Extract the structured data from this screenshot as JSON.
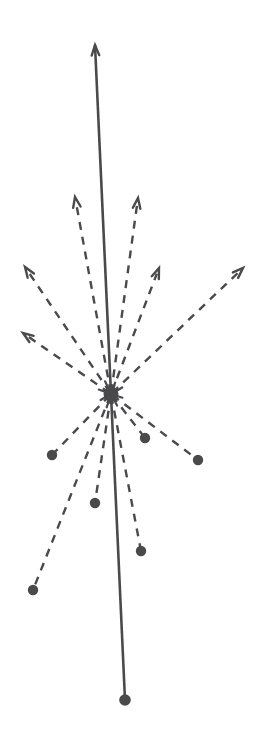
{
  "figure": {
    "type": "vector-field-radial",
    "canvas": {
      "width": 274,
      "height": 745,
      "background_color": "#ffffff"
    },
    "style": {
      "stroke_color": "#4a4a4d",
      "solid_stroke_width": 2.6,
      "dashed_stroke_width": 2.4,
      "dash_pattern": "8 7",
      "arrowhead_stroke_width": 2.4,
      "arrowhead_length": 11,
      "arrowhead_half_angle_deg": 20,
      "dot_radius": 5.2,
      "hub_radius": 7.5
    },
    "hub": {
      "label": "center-hub",
      "x": 111,
      "y": 394,
      "radius": 7.5
    },
    "axis": {
      "label": "principal-axis",
      "kind": "solid",
      "terminal_top": "arrowhead",
      "terminal_bottom": "dot",
      "top_x": 95,
      "top_y": 45,
      "bottom_x": 125,
      "bottom_y": 700
    },
    "vectors": [
      {
        "id": "v1",
        "label": "dashed-vector-up-left-near",
        "terminal": "arrowhead",
        "x": 75,
        "y": 197,
        "length": 198,
        "angle_deg": 100.4
      },
      {
        "id": "v2",
        "label": "dashed-vector-up-right-near",
        "terminal": "arrowhead",
        "x": 138,
        "y": 198,
        "length": 198,
        "angle_deg": 81.9
      },
      {
        "id": "v3",
        "label": "dashed-vector-upper-left-far",
        "terminal": "arrowhead",
        "x": 25,
        "y": 267,
        "length": 152,
        "angle_deg": 123.2
      },
      {
        "id": "v4",
        "label": "dashed-vector-left",
        "terminal": "arrowhead",
        "x": 23,
        "y": 333,
        "length": 107,
        "angle_deg": 144.6
      },
      {
        "id": "v5",
        "label": "dashed-vector-upper-right-mid",
        "terminal": "arrowhead",
        "x": 159,
        "y": 268,
        "length": 135,
        "angle_deg": 69.2
      },
      {
        "id": "v6",
        "label": "dashed-vector-right-far",
        "terminal": "arrowhead",
        "x": 243,
        "y": 268,
        "length": 183,
        "angle_deg": 40.4
      },
      {
        "id": "v7",
        "label": "dashed-vector-lower-left-short",
        "terminal": "dot",
        "x": 52,
        "y": 455,
        "length": 84,
        "angle_deg": -135.9
      },
      {
        "id": "v8",
        "label": "dashed-vector-lower-right-short",
        "terminal": "dot",
        "x": 145,
        "y": 438,
        "length": 56,
        "angle_deg": -52.3
      },
      {
        "id": "v9",
        "label": "dashed-vector-lower-right-mid",
        "terminal": "dot",
        "x": 198,
        "y": 460,
        "length": 108,
        "angle_deg": -37.2
      },
      {
        "id": "v10",
        "label": "dashed-vector-down-left-mid",
        "terminal": "dot",
        "x": 95,
        "y": 503,
        "length": 110,
        "angle_deg": -98.3
      },
      {
        "id": "v11",
        "label": "dashed-vector-down-right-long",
        "terminal": "dot",
        "x": 141,
        "y": 551,
        "length": 160,
        "angle_deg": -79.3
      },
      {
        "id": "v12",
        "label": "dashed-vector-lower-left-long",
        "terminal": "dot",
        "x": 33,
        "y": 590,
        "length": 211,
        "angle_deg": -111.7
      }
    ]
  }
}
